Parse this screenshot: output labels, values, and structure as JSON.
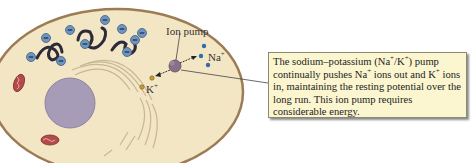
{
  "figure": {
    "top_cut_text": "",
    "labels": {
      "ion_pump": "Ion pump",
      "na_ion": "Na",
      "na_charge": "+",
      "k_ion": "K",
      "k_charge": "+"
    },
    "callout": {
      "text_parts": [
        "The sodium–potassium (Na",
        "+",
        "/K",
        "+",
        ") pump continually pushes Na",
        "+",
        " ions out and K",
        "+",
        " ions in, maintaining the resting potential over the long run. This ion pump requires considerable energy."
      ]
    },
    "colors": {
      "cytoplasm": "#f3e6c4",
      "membrane": "#9c7b55",
      "nucleus": "#a79cb8",
      "protein_anion": "#6f95bf",
      "sodium_ion": "#2e6ea8",
      "potassium_ion": "#c99a3a",
      "mitochondrion": "#b44a4a",
      "ion_pump": "#8a6f8c",
      "callout_bg": "#fbf6cf"
    }
  }
}
